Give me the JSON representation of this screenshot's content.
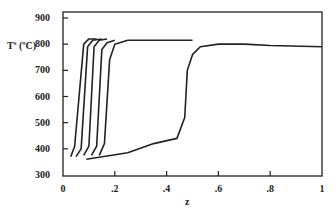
{
  "chart_data": {
    "type": "line",
    "title": "",
    "xlabel": "z",
    "ylabel": "T^s (ºC)",
    "xlim": [
      0,
      1
    ],
    "ylim": [
      300,
      900
    ],
    "grid": false,
    "legend": null,
    "x_ticks": [
      "0",
      ".2",
      ".4",
      ".6",
      ".8",
      "1"
    ],
    "y_ticks": [
      "300",
      "400",
      "500",
      "600",
      "700",
      "800",
      "900"
    ],
    "series": [
      {
        "name": "curve-1",
        "x": [
          0.03,
          0.045,
          0.08,
          0.1,
          0.13
        ],
        "y": [
          370,
          410,
          800,
          820,
          820
        ]
      },
      {
        "name": "curve-2",
        "x": [
          0.05,
          0.07,
          0.095,
          0.115,
          0.15
        ],
        "y": [
          370,
          400,
          790,
          815,
          820
        ]
      },
      {
        "name": "curve-3",
        "x": [
          0.08,
          0.1,
          0.12,
          0.14,
          0.17
        ],
        "y": [
          375,
          410,
          790,
          815,
          820
        ]
      },
      {
        "name": "curve-4",
        "x": [
          0.11,
          0.13,
          0.15,
          0.17,
          0.2
        ],
        "y": [
          375,
          410,
          780,
          805,
          815
        ]
      },
      {
        "name": "curve-5",
        "x": [
          0.14,
          0.16,
          0.18,
          0.2,
          0.25,
          0.5
        ],
        "y": [
          375,
          420,
          740,
          800,
          815,
          815
        ]
      },
      {
        "name": "curve-6",
        "x": [
          0.09,
          0.25,
          0.35,
          0.44,
          0.47,
          0.48,
          0.5,
          0.53,
          0.6,
          0.7,
          0.8,
          1.0
        ],
        "y": [
          360,
          385,
          420,
          440,
          520,
          700,
          760,
          790,
          800,
          800,
          795,
          790
        ]
      }
    ]
  },
  "labels": {
    "ylabel_main": "T",
    "ylabel_sup": "s",
    "ylabel_unit": "(ºC)",
    "xlabel": "z"
  }
}
